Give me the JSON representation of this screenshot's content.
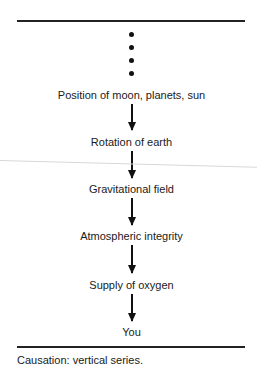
{
  "diagram": {
    "type": "vertical causal chain",
    "ellipsis_dots": 4,
    "nodes": [
      {
        "label": "Position of moon, planets, sun"
      },
      {
        "label": "Rotation of earth"
      },
      {
        "label": "Gravitational field"
      },
      {
        "label": "Atmospheric integrity"
      },
      {
        "label": "Supply of oxygen"
      },
      {
        "label": "You"
      }
    ],
    "edges": [
      {
        "from": "Position of moon, planets, sun",
        "to": "Rotation of earth"
      },
      {
        "from": "Rotation of earth",
        "to": "Gravitational field"
      },
      {
        "from": "Gravitational field",
        "to": "Atmospheric integrity"
      },
      {
        "from": "Atmospheric integrity",
        "to": "Supply of oxygen"
      },
      {
        "from": "Supply of oxygen",
        "to": "You"
      }
    ],
    "caption": "Causation: vertical series."
  }
}
